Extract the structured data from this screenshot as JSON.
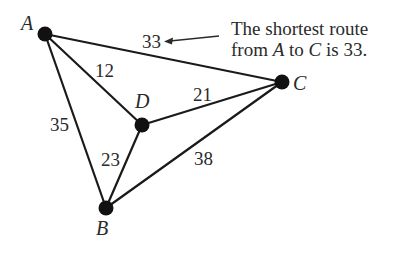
{
  "graph": {
    "nodes": [
      {
        "id": "A",
        "label": "A",
        "x": 45,
        "y": 34
      },
      {
        "id": "B",
        "label": "B",
        "x": 106,
        "y": 208
      },
      {
        "id": "C",
        "label": "C",
        "x": 282,
        "y": 82
      },
      {
        "id": "D",
        "label": "D",
        "x": 142,
        "y": 125
      }
    ],
    "edges": [
      {
        "from": "A",
        "to": "C",
        "weight": "33"
      },
      {
        "from": "A",
        "to": "D",
        "weight": "12"
      },
      {
        "from": "A",
        "to": "B",
        "weight": "35"
      },
      {
        "from": "D",
        "to": "C",
        "weight": "21"
      },
      {
        "from": "D",
        "to": "B",
        "weight": "23"
      },
      {
        "from": "B",
        "to": "C",
        "weight": "38"
      }
    ]
  },
  "annotation": {
    "line1": "The shortest route",
    "line2_prefix": "from ",
    "line2_from": "A",
    "line2_mid": " to ",
    "line2_to": "C",
    "line2_suffix": " is 33.",
    "points_to_edge": "A-C"
  },
  "colors": {
    "ink": "#1a1a1a",
    "background": "#ffffff"
  }
}
